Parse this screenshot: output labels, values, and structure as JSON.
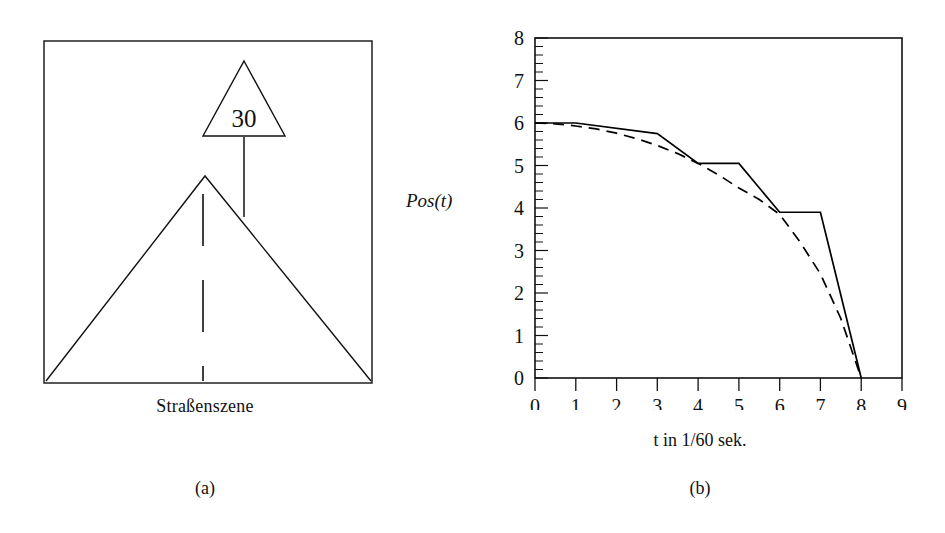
{
  "figure": {
    "panel_a": {
      "caption": "(a)",
      "scene_label": "Straßenszene",
      "sign_value": "30",
      "sign_shape": "triangle",
      "elements": [
        "road-outline",
        "center-dashed-line",
        "speed-limit-sign",
        "sign-post",
        "frame-box"
      ]
    },
    "panel_b": {
      "caption": "(b)"
    }
  },
  "chart_data": {
    "type": "line",
    "title": "",
    "xlabel": "t in 1/60 sek.",
    "ylabel": "Pos(t)",
    "xlim": [
      0,
      9
    ],
    "ylim": [
      0,
      8
    ],
    "xticks": [
      0,
      1,
      2,
      3,
      4,
      5,
      6,
      7,
      8,
      9
    ],
    "yticks": [
      0,
      1,
      2,
      3,
      4,
      5,
      6,
      7,
      8
    ],
    "xtick_labels": [
      "0",
      "1",
      "2",
      "3",
      "4",
      "5",
      "6",
      "7",
      "8",
      "9"
    ],
    "ytick_labels": [
      "0",
      "1",
      "2",
      "3",
      "4",
      "5",
      "6",
      "7",
      "8"
    ],
    "minor_ticks_per_unit_y": 5,
    "grid": false,
    "legend": "none",
    "frame": true,
    "line_color": "#000000",
    "series": [
      {
        "name": "quantisierte Position (Treppenfunktion)",
        "style": "solid",
        "x": [
          0,
          1,
          3,
          3,
          4,
          5,
          5,
          6,
          7,
          7,
          8
        ],
        "y": [
          6.0,
          6.0,
          5.75,
          5.75,
          5.05,
          5.05,
          5.05,
          3.9,
          3.9,
          3.9,
          0.0
        ],
        "points": [
          {
            "x": 0,
            "y": 6.0
          },
          {
            "x": 1,
            "y": 6.0
          },
          {
            "x": 3,
            "y": 5.75
          },
          {
            "x": 4,
            "y": 5.05
          },
          {
            "x": 5,
            "y": 5.05
          },
          {
            "x": 6,
            "y": 3.9
          },
          {
            "x": 7,
            "y": 3.9
          },
          {
            "x": 8,
            "y": 0.0
          }
        ]
      },
      {
        "name": "kontinuierliche Position",
        "style": "dashed",
        "x": [
          0,
          0.5,
          1,
          1.5,
          2,
          2.5,
          3,
          3.5,
          4,
          4.5,
          5,
          5.5,
          6,
          6.5,
          7,
          7.5,
          8
        ],
        "y": [
          6.0,
          5.98,
          5.93,
          5.86,
          5.76,
          5.63,
          5.47,
          5.28,
          5.05,
          4.78,
          4.47,
          4.2,
          3.85,
          3.2,
          2.45,
          1.4,
          0.0
        ]
      }
    ]
  }
}
